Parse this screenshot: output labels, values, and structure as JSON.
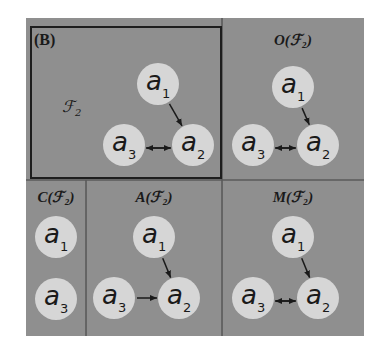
{
  "figure_label": "(B)",
  "family_label": "ℱ₂",
  "panels": [
    {
      "id": "B",
      "title": "",
      "nodes": [
        "a1",
        "a2",
        "a3"
      ],
      "edges": [
        [
          "a1",
          "a2"
        ],
        [
          "a3",
          "a2"
        ],
        [
          "a2",
          "a3"
        ]
      ]
    },
    {
      "id": "O",
      "title": "O(ℱ₂)",
      "nodes": [
        "a1",
        "a2",
        "a3"
      ],
      "edges": [
        [
          "a1",
          "a2"
        ],
        [
          "a3",
          "a2"
        ],
        [
          "a2",
          "a3"
        ]
      ]
    },
    {
      "id": "C",
      "title": "C(ℱ₂)",
      "nodes": [
        "a1",
        "a3"
      ],
      "edges": []
    },
    {
      "id": "A",
      "title": "A(ℱ₂)",
      "nodes": [
        "a1",
        "a2",
        "a3"
      ],
      "edges": [
        [
          "a1",
          "a2"
        ],
        [
          "a3",
          "a2"
        ]
      ]
    },
    {
      "id": "M",
      "title": "M(ℱ₂)",
      "nodes": [
        "a1",
        "a2",
        "a3"
      ],
      "edges": [
        [
          "a1",
          "a2"
        ],
        [
          "a3",
          "a2"
        ],
        [
          "a2",
          "a3"
        ]
      ]
    }
  ],
  "node_labels": {
    "a1": {
      "base": "a",
      "sub": "1"
    },
    "a2": {
      "base": "a",
      "sub": "2"
    },
    "a3": {
      "base": "a",
      "sub": "3"
    }
  },
  "colors": {
    "panel": "#8f8f8f",
    "node": "#d6d6d6",
    "ink": "#1a1a1a"
  }
}
